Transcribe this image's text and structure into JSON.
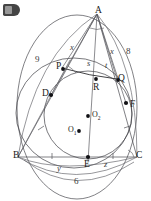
{
  "figure": {
    "badge_name": "corner-logo-badge",
    "stroke_color": "#55555a",
    "accent_color": "#1a1a1a",
    "background": "#ffffff"
  },
  "points": [
    {
      "id": "A",
      "label": "A",
      "x": 97,
      "y": 14,
      "dot": false
    },
    {
      "id": "B",
      "label": "B",
      "x": 18,
      "y": 157,
      "dot": false
    },
    {
      "id": "C",
      "label": "C",
      "x": 137,
      "y": 157,
      "dot": false
    },
    {
      "id": "D",
      "label": "D",
      "x": 51,
      "y": 95,
      "dot": true,
      "dx": 56,
      "dy": 95
    },
    {
      "id": "E",
      "label": "E",
      "x": 88,
      "y": 162,
      "dot": true,
      "dx": 85,
      "dy": 155
    },
    {
      "id": "F",
      "label": "F",
      "x": 126,
      "y": 103,
      "dot": true,
      "dx": 119,
      "dy": 103
    },
    {
      "id": "P",
      "label": "P",
      "x": 62,
      "y": 68,
      "dot": true,
      "dx": 69,
      "dy": 71
    },
    {
      "id": "Q",
      "label": "Q",
      "x": 117,
      "y": 79,
      "dot": true,
      "dx": 115,
      "dy": 76
    },
    {
      "id": "R",
      "label": "R",
      "x": 94,
      "y": 87,
      "dot": true,
      "dx": 96,
      "dy": 78
    },
    {
      "id": "O2",
      "label": "O",
      "subscript": "2",
      "x": 92,
      "y": 115,
      "dot": true,
      "dx": 87,
      "dy": 114
    },
    {
      "id": "O1",
      "label": "O",
      "subscript": "1",
      "x": 64,
      "y": 129,
      "dot": true,
      "dx": 77,
      "dy": 127
    }
  ],
  "labels": [
    {
      "name": "label-9",
      "text": "9",
      "x": 35,
      "y": 58,
      "kind": "num"
    },
    {
      "name": "label-8",
      "text": "8",
      "x": 126,
      "y": 50,
      "kind": "num"
    },
    {
      "name": "label-6",
      "text": "6",
      "x": 74,
      "y": 180,
      "kind": "num"
    },
    {
      "name": "label-x-left",
      "text": "x",
      "x": 70,
      "y": 46,
      "kind": "var"
    },
    {
      "name": "label-x-right",
      "text": "x",
      "x": 110,
      "y": 50,
      "kind": "var"
    },
    {
      "name": "label-s",
      "text": "s",
      "x": 87,
      "y": 62,
      "kind": "var"
    },
    {
      "name": "label-t",
      "text": "t",
      "x": 105,
      "y": 64,
      "kind": "var"
    },
    {
      "name": "label-y",
      "text": "y",
      "x": 57,
      "y": 167,
      "kind": "var"
    },
    {
      "name": "label-z",
      "text": "z",
      "x": 104,
      "y": 163,
      "kind": "var"
    }
  ],
  "circles": [
    {
      "name": "circumcircle",
      "cx": 77,
      "cy": 112,
      "r": 74,
      "note": "outer circle through A, B, C"
    },
    {
      "name": "middle-circle",
      "cx": 77,
      "cy": 110,
      "r": 55,
      "note": "circle through D, P, Q, F, E"
    },
    {
      "name": "incircle",
      "cx": 92,
      "cy": 115,
      "r": 43,
      "note": "inner circle centered at O2"
    }
  ],
  "segments": [
    {
      "name": "side-AB",
      "from": "A",
      "to": "B"
    },
    {
      "name": "side-AC",
      "from": "A",
      "to": "C"
    },
    {
      "name": "side-BC",
      "from": "B",
      "to": "C"
    },
    {
      "name": "cevian-AE",
      "from": "A",
      "to": "E"
    },
    {
      "name": "cevian-AF",
      "from": "A",
      "to": "F"
    },
    {
      "name": "cevian-AQ",
      "from": "A",
      "to": "Q"
    },
    {
      "name": "chord-PQ",
      "from": "P",
      "to": "Q"
    },
    {
      "name": "chord-BD",
      "from": "B",
      "to": "D"
    }
  ],
  "tick_marks": [
    {
      "name": "tick-BE",
      "x": 52,
      "y": 155
    },
    {
      "name": "tick-EC",
      "x": 113,
      "y": 155
    }
  ]
}
